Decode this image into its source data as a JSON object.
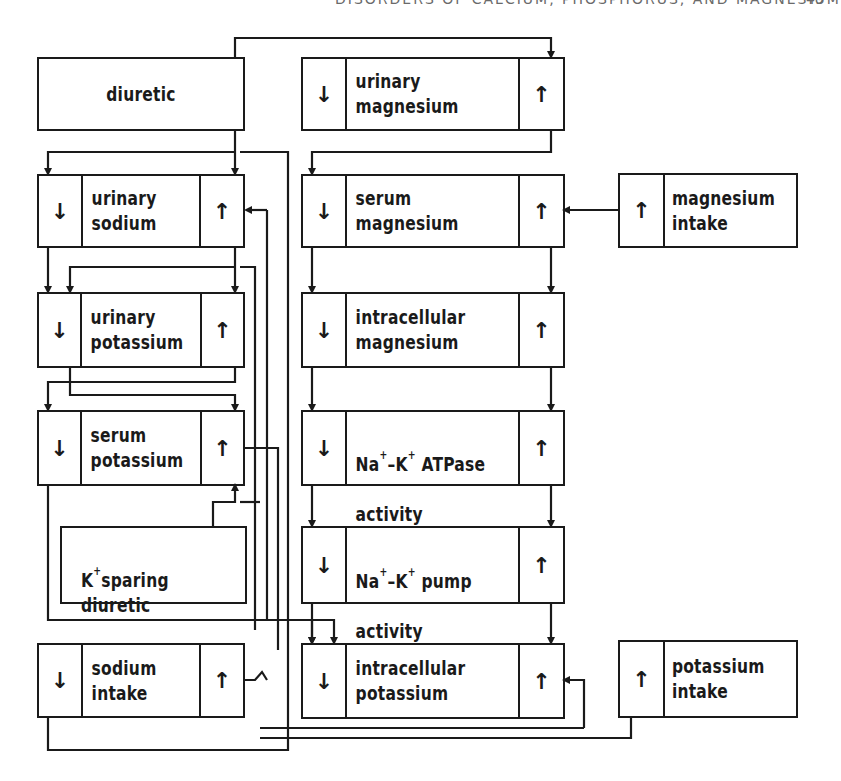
{
  "page": {
    "running_head": "DISORDERS OF CALCIUM, PHOSPHORUS, AND MAGNESIUM",
    "page_number": "49"
  },
  "icons": {
    "decrease": "↓",
    "increase": "↑"
  },
  "left_column": {
    "diuretic": {
      "label": "diuretic"
    },
    "urinary_sodium": {
      "label": "urinary\nsodium",
      "down": "↓",
      "up": "↑"
    },
    "urinary_potassium": {
      "label": "urinary\npotassium",
      "down": "↓",
      "up": "↑"
    },
    "serum_potassium": {
      "label": "serum\npotassium",
      "down": "↓",
      "up": "↑"
    },
    "k_sparing_diuretic": {
      "label_k": "K",
      "label_sup": "+",
      "label_rest": "sparing\ndiuretic"
    },
    "sodium_intake": {
      "label": "sodium\nintake",
      "down": "↓",
      "up": "↑"
    }
  },
  "middle_column": {
    "urinary_magnesium": {
      "label": "urinary\nmagnesium",
      "down": "↓",
      "up": "↑"
    },
    "serum_magnesium": {
      "label": "serum\nmagnesium",
      "down": "↓",
      "up": "↑"
    },
    "intracellular_magnesium": {
      "label": "intracellular\nmagnesium",
      "down": "↓",
      "up": "↑"
    },
    "atpase_activity": {
      "label_na": "Na",
      "sup1": "+",
      "dash": "–K",
      "sup2": "+",
      "label_rest": " ATPase",
      "line2": "activity",
      "down": "↓",
      "up": "↑"
    },
    "pump_activity": {
      "label_na": "Na",
      "sup1": "+",
      "dash": "–K",
      "sup2": "+",
      "label_rest": " pump",
      "line2": "activity",
      "down": "↓",
      "up": "↑"
    },
    "intracellular_potassium": {
      "label": "intracellular\npotassium",
      "down": "↓",
      "up": "↑"
    }
  },
  "right_column": {
    "magnesium_intake": {
      "label": "magnesium\nintake",
      "up": "↑"
    },
    "potassium_intake": {
      "label": "potassium\nintake",
      "up": "↑"
    }
  },
  "colors": {
    "ink": "#1a1a1a",
    "paper": "#ffffff"
  }
}
